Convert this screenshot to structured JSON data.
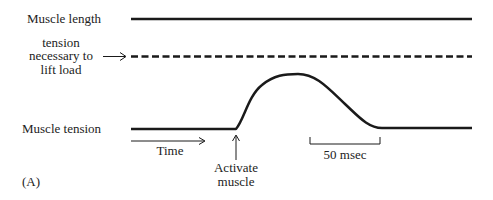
{
  "figure": {
    "panel_label": "(A)",
    "labels": {
      "muscle_length": "Muscle length",
      "tension_line1": "tension",
      "tension_line2": "necessary to",
      "tension_line3": "lift load",
      "muscle_tension": "Muscle tension",
      "time": "Time",
      "activate_line1": "Activate",
      "activate_line2": "muscle",
      "scale_bar": "50 msec"
    },
    "colors": {
      "ink": "#1a1a1a",
      "background": "#ffffff"
    }
  }
}
